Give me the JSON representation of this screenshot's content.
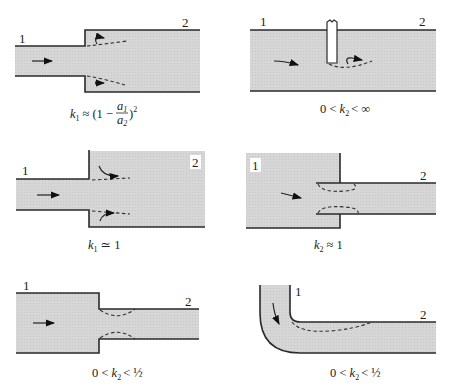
{
  "figure": {
    "fill_color": "#d4d4d4",
    "wall_color": "#2a2a2a",
    "panels": [
      {
        "id": "sudden-expansion",
        "station_labels": [
          "1",
          "2"
        ],
        "caption": {
          "k": "k",
          "sub": "1",
          "rel": "≈",
          "expr_pre": "(1 −",
          "frac_num": "a",
          "frac_num_sub": "1",
          "frac_den": "a",
          "frac_den_sub": "2",
          "expr_post": ")",
          "power": "2"
        }
      },
      {
        "id": "gate-valve-obstruction",
        "station_labels": [
          "1",
          "2"
        ],
        "caption": {
          "pre": "0 <",
          "k": "k",
          "sub": "2",
          "post": "< ∞"
        }
      },
      {
        "id": "pipe-to-reservoir-exit",
        "station_labels": [
          "1",
          "2"
        ],
        "caption": {
          "pre": "",
          "k": "k",
          "sub": "1",
          "post": "≃ 1"
        }
      },
      {
        "id": "reentrant-inlet",
        "station_labels": [
          "1",
          "2"
        ],
        "caption": {
          "pre": "",
          "k": "k",
          "sub": "2",
          "post": "≈ 1"
        }
      },
      {
        "id": "sudden-contraction",
        "station_labels": [
          "1",
          "2"
        ],
        "caption": {
          "pre": "0 <",
          "k": "k",
          "sub": "2",
          "post": "< ½"
        }
      },
      {
        "id": "elbow-bend",
        "station_labels": [
          "1",
          "2"
        ],
        "caption": {
          "pre": "0 <",
          "k": "k",
          "sub": "2",
          "post": "< ½"
        }
      }
    ]
  }
}
